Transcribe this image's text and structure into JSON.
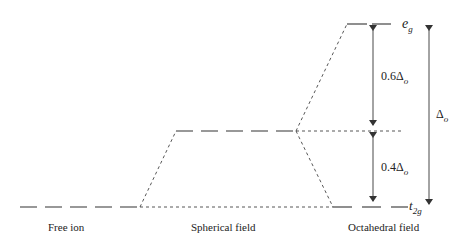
{
  "diagram": {
    "columns": [
      {
        "id": "free",
        "label": "Free ion"
      },
      {
        "id": "spherical",
        "label": "Spherical field"
      },
      {
        "id": "octahedral",
        "label": "Octahedral field"
      }
    ],
    "levels": {
      "eg": {
        "symbol": "e",
        "subscript": "g"
      },
      "t2g": {
        "symbol": "t",
        "subscript": "2g"
      }
    },
    "energy_gaps": [
      {
        "id": "upper",
        "prefix": "0.6",
        "symbol": "Δ",
        "subscript": "o",
        "fraction": 0.6
      },
      {
        "id": "lower",
        "prefix": "0.4",
        "symbol": "Δ",
        "subscript": "o",
        "fraction": 0.4
      },
      {
        "id": "total",
        "prefix": "",
        "symbol": "Δ",
        "subscript": "o",
        "fraction": 1.0
      }
    ],
    "colors": {
      "line": "#333333",
      "text": "#222222"
    }
  }
}
